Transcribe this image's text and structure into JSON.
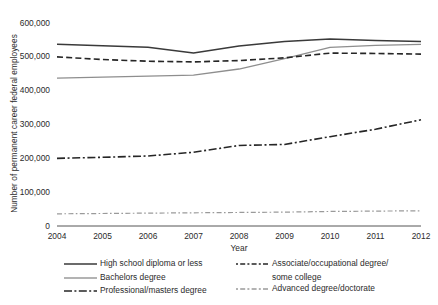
{
  "chart_data": {
    "type": "line",
    "title": "",
    "xlabel": "Year",
    "ylabel": "Number of permanent career federal employees",
    "x": [
      2004,
      2005,
      2006,
      2007,
      2008,
      2009,
      2010,
      2011,
      2012
    ],
    "xtick_labels": [
      "2004",
      "2005",
      "2006",
      "2007",
      "2008",
      "2009",
      "2010",
      "2011",
      "2012"
    ],
    "ytick_labels": [
      "600,000",
      "500,000",
      "400,000",
      "300,000",
      "200,000",
      "100,000",
      "0"
    ],
    "ytick_values": [
      600000,
      500000,
      400000,
      300000,
      200000,
      100000,
      0
    ],
    "xlim": [
      2004,
      2012
    ],
    "ylim": [
      0,
      600000
    ],
    "grid": false,
    "legend_position": "below",
    "series": [
      {
        "name": "High school diploma or less",
        "style": "solid",
        "color": "#3a3a3a",
        "width": 1.5,
        "values": [
          537000,
          533000,
          528000,
          511000,
          532000,
          545000,
          553000,
          548000,
          545000
        ]
      },
      {
        "name": "Bachelors degree",
        "style": "solid",
        "color": "#8e8e8e",
        "width": 1.3,
        "values": [
          437000,
          440000,
          443000,
          446000,
          464000,
          495000,
          528000,
          534000,
          537000
        ]
      },
      {
        "name": "Associate/occupational degree/ some college",
        "style": "dashed",
        "color": "#262626",
        "width": 1.6,
        "values": [
          500000,
          492000,
          487000,
          485000,
          489000,
          497000,
          511000,
          510000,
          508000
        ]
      },
      {
        "name": "Professional/masters degree",
        "style": "dashdot",
        "color": "#262626",
        "width": 1.6,
        "values": [
          200000,
          203000,
          207000,
          218000,
          238000,
          241000,
          264000,
          286000,
          314000
        ]
      },
      {
        "name": "Advanced degree/doctorate",
        "style": "dashdot-light",
        "color": "#9a9a9a",
        "width": 1.2,
        "values": [
          36000,
          37000,
          38000,
          39000,
          40000,
          41000,
          43000,
          44000,
          45000
        ]
      }
    ]
  },
  "legend": {
    "left_items": [
      {
        "label": "High school diploma or less",
        "swatch": "solid-dark-line-swatch"
      },
      {
        "label": "Bachelors degree",
        "swatch": "solid-gray-line-swatch"
      },
      {
        "label": "Professional/masters degree",
        "swatch": "dashdot-dark-line-swatch"
      }
    ],
    "right_items": [
      {
        "label": "Associate/occupational degree/",
        "label2": "some college",
        "swatch": "dashed-dark-line-swatch"
      },
      {
        "label": "Advanced degree/doctorate",
        "label2": "",
        "swatch": "dashdot-light-line-swatch"
      }
    ]
  },
  "axis": {
    "axis_color": "#555555"
  }
}
